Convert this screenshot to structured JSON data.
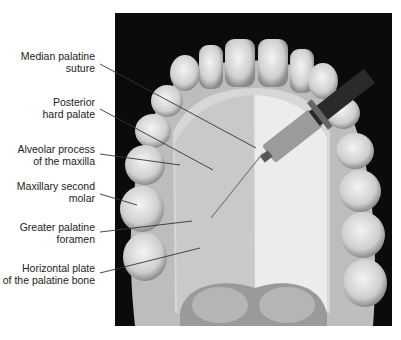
{
  "figure": {
    "labels": [
      {
        "id": "median-palatine-suture",
        "line1": "Median palatine",
        "line2": "suture"
      },
      {
        "id": "posterior-hard-palate",
        "line1": "Posterior",
        "line2": "hard palate"
      },
      {
        "id": "alveolar-process",
        "line1": "Alveolar process",
        "line2": "of the maxilla"
      },
      {
        "id": "maxillary-second-molar",
        "line1": "Maxillary second",
        "line2": "molar"
      },
      {
        "id": "greater-palatine-foramen",
        "line1": "Greater palatine",
        "line2": "foramen"
      },
      {
        "id": "horizontal-plate",
        "line1": "Horizontal plate",
        "line2": "of the palatine bone"
      }
    ]
  }
}
